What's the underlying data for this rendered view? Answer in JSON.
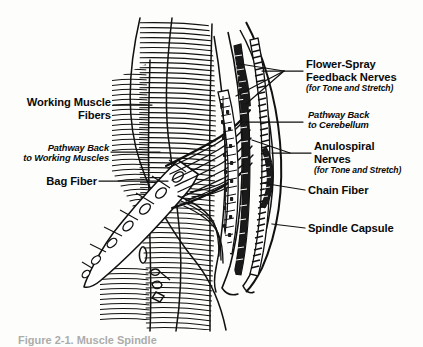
{
  "figure": {
    "background_color": "#fdfdfb",
    "ink_color": "#0a0a0a",
    "caption": "Figure 2-1. Muscle Spindle"
  },
  "labels": {
    "working_muscle_fibers": {
      "line1": "Working Muscle",
      "line2": "Fibers"
    },
    "pathway_back_to_working_muscles": {
      "line1": "Pathway Back",
      "line2": "to Working Muscles"
    },
    "bag_fiber": {
      "line1": "Bag Fiber"
    },
    "flower_spray_feedback_nerves": {
      "line1": "Flower-Spray",
      "line2": "Feedback Nerves",
      "sub": "(for Tone and Stretch)"
    },
    "pathway_back_to_cerebellum": {
      "line1": "Pathway Back",
      "line2": "to Cerebellum"
    },
    "anulospiral_nerves": {
      "line1": "Anulospiral",
      "line2": "Nerves",
      "sub": "(for Tone and Stretch)"
    },
    "chain_fiber": {
      "line1": "Chain Fiber"
    },
    "spindle_capsule": {
      "line1": "Spindle Capsule"
    }
  }
}
